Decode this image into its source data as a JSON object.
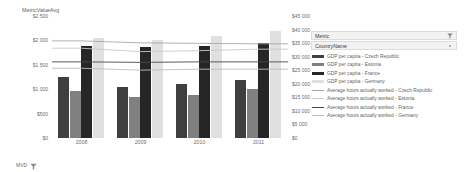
{
  "axis_title": "MetricValueAvg",
  "left_axis": {
    "ticks": [
      "$2 500",
      "$2 000",
      "$1 500",
      "$1 000",
      "$500",
      "$0"
    ],
    "values": [
      2500,
      2000,
      1500,
      1000,
      500,
      0
    ]
  },
  "right_axis": {
    "ticks": [
      "$45 000",
      "$40 000",
      "$35 000",
      "$30 000",
      "$25 000",
      "$20 000",
      "$15 000",
      "$10 000",
      "$5 000",
      "$0"
    ],
    "values": [
      45000,
      40000,
      35000,
      30000,
      25000,
      20000,
      15000,
      10000,
      5000,
      0
    ]
  },
  "legend": {
    "header_metric": "Metric",
    "header_country": "CountryName",
    "filter_icon": "filter-icon",
    "dropdown_icon": "dropdown-dot-icon",
    "items": [
      {
        "label": "GDP per capita - Czech Republic",
        "color": "#3f3f3f",
        "kind": "bar"
      },
      {
        "label": "GDP per capita - Estonia",
        "color": "#808080",
        "kind": "bar"
      },
      {
        "label": "GDP per capita - France",
        "color": "#262626",
        "kind": "bar"
      },
      {
        "label": "GDP per capita - Germany",
        "color": "#e0e0e0",
        "kind": "bar"
      },
      {
        "label": "Average hours actually worked - Czech Republic",
        "color": "#a8a8a8",
        "kind": "line"
      },
      {
        "label": "Average hours actually worked - Estonia",
        "color": "#c9c9c9",
        "kind": "line"
      },
      {
        "label": "Average hours actually worked - France",
        "color": "#4a4a4a",
        "kind": "line"
      },
      {
        "label": "Average hours actually worked - Germany",
        "color": "#bdbdbd",
        "kind": "line"
      }
    ]
  },
  "bottom_control": {
    "label": "MVD",
    "icon": "filter-icon"
  },
  "chart_data": {
    "type": "bar",
    "title": "MetricValueAvg",
    "xlabel": "",
    "ylabel": "MetricValueAvg",
    "grid": false,
    "legend_position": "right",
    "categories": [
      "2008",
      "2009",
      "2010",
      "2011"
    ],
    "y_left_label": "MetricValueAvg",
    "y_left_lim": [
      0,
      2500
    ],
    "y_left_ticks": [
      0,
      500,
      1000,
      1500,
      2000,
      2500
    ],
    "y_right_label": "GDP per capita",
    "y_right_lim": [
      0,
      45000
    ],
    "y_right_ticks": [
      0,
      5000,
      10000,
      15000,
      20000,
      25000,
      30000,
      35000,
      40000,
      45000
    ],
    "bar_series": [
      {
        "name": "GDP per capita - Czech Republic",
        "color": "#3f3f3f",
        "axis": "right",
        "values": [
          22500,
          19000,
          20000,
          21500
        ]
      },
      {
        "name": "GDP per capita - Estonia",
        "color": "#808080",
        "axis": "right",
        "values": [
          17500,
          15000,
          16000,
          18000
        ]
      },
      {
        "name": "GDP per capita - France",
        "color": "#262626",
        "axis": "right",
        "values": [
          34000,
          33500,
          34000,
          35000
        ]
      },
      {
        "name": "GDP per capita - Germany",
        "color": "#e0e0e0",
        "axis": "right",
        "values": [
          37000,
          36000,
          37500,
          39500
        ]
      }
    ],
    "line_series": [
      {
        "name": "Average hours actually worked - Czech Republic",
        "color": "#a8a8a8",
        "axis": "left",
        "values": [
          1990,
          1950,
          1940,
          1930
        ]
      },
      {
        "name": "Average hours actually worked - Estonia",
        "color": "#c9c9c9",
        "axis": "left",
        "values": [
          1840,
          1770,
          1790,
          1820
        ]
      },
      {
        "name": "Average hours actually worked - France",
        "color": "#4a4a4a",
        "axis": "left",
        "values": [
          1560,
          1550,
          1560,
          1560
        ]
      },
      {
        "name": "Average hours actually worked - Germany",
        "color": "#bdbdbd",
        "axis": "left",
        "values": [
          1430,
          1390,
          1410,
          1410
        ]
      }
    ]
  }
}
